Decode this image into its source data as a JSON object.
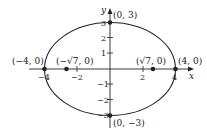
{
  "diagram": {
    "type": "ellipse",
    "colors": {
      "stroke": "#222222",
      "background": "#ffffff"
    },
    "axes": {
      "x_label": "x",
      "y_label": "y",
      "x_ticks": [
        {
          "value": -4,
          "label": "−4"
        },
        {
          "value": -2,
          "label": "−2"
        },
        {
          "value": 2,
          "label": "2"
        },
        {
          "value": 4,
          "label": "4"
        }
      ],
      "y_ticks": [
        {
          "value": 3,
          "label": "3"
        },
        {
          "value": 2,
          "label": "2"
        },
        {
          "value": 1,
          "label": "1"
        },
        {
          "value": -1,
          "label": "−1"
        },
        {
          "value": -2,
          "label": "−2"
        },
        {
          "value": -3,
          "label": "−3"
        }
      ]
    },
    "ellipse": {
      "a": 4,
      "b": 3,
      "center": [
        0,
        0
      ]
    },
    "points": [
      {
        "name": "vertex-left",
        "x": -4,
        "y": 0,
        "label": "(−4, 0)"
      },
      {
        "name": "vertex-right",
        "x": 4,
        "y": 0,
        "label": "(4, 0)"
      },
      {
        "name": "covertex-top",
        "x": 0,
        "y": 3,
        "label": "(0, 3)"
      },
      {
        "name": "covertex-bottom",
        "x": 0,
        "y": -3,
        "label": "(0, −3)"
      },
      {
        "name": "focus-left",
        "x": -2.6458,
        "y": 0,
        "label_prefix": "(−",
        "label_radical": "√7",
        "label_suffix": ", 0)"
      },
      {
        "name": "focus-right",
        "x": 2.6458,
        "y": 0,
        "label_prefix": "(",
        "label_radical": "√7",
        "label_suffix": ", 0)"
      }
    ]
  }
}
